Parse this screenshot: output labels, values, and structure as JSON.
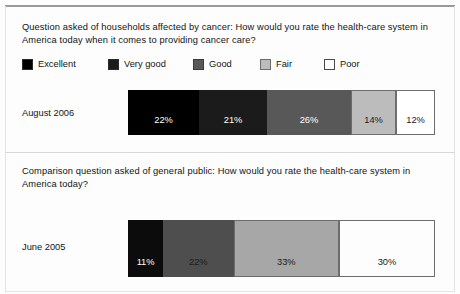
{
  "figure": {
    "top_rule_color": "#9a9a9a",
    "background": "#fdfdfd"
  },
  "sections": [
    {
      "question": "Question asked of households affected by cancer: How would you rate the health-care system in America today when it comes to providing cancer care?",
      "row_label": "August 2006"
    },
    {
      "question": "Comparison question asked of general public: How would you rate the health-care system in America today?",
      "row_label": "June 2005"
    }
  ],
  "legend": {
    "items": [
      {
        "label": "Excellent",
        "color": "#000000",
        "border": "#2b2b2b"
      },
      {
        "label": "Very good",
        "color": "#1b1b1b",
        "border": "#2b2b2b"
      },
      {
        "label": "Good",
        "color": "#585858",
        "border": "#3a3a3a"
      },
      {
        "label": "Fair",
        "color": "#bcbcbc",
        "border": "#6d6d6d"
      },
      {
        "label": "Poor",
        "color": "#ffffff",
        "border": "#4a4a4a"
      }
    ]
  },
  "chart_data": {
    "type": "bar",
    "orientation": "horizontal",
    "stacked": true,
    "percent_total": 100,
    "title": "",
    "xlabel": "",
    "ylabel": "",
    "grid": false,
    "legend_position": "top",
    "categories": [
      "Excellent",
      "Very good",
      "Good",
      "Fair",
      "Poor"
    ],
    "series": [
      {
        "name": "August 2006",
        "question": "Question asked of households affected by cancer: How would you rate the health-care system in America today when it comes to providing cancer care?",
        "segments": [
          {
            "category": "Excellent",
            "value": 22,
            "label": "22%",
            "color": "#000000",
            "text_color": "#ffffff"
          },
          {
            "category": "Very good",
            "value": 21,
            "label": "21%",
            "color": "#1b1b1b",
            "text_color": "#ffffff"
          },
          {
            "category": "Good",
            "value": 26,
            "label": "26%",
            "color": "#585858",
            "text_color": "#ffffff"
          },
          {
            "category": "Fair",
            "value": 14,
            "label": "14%",
            "color": "#bcbcbc",
            "text_color": "#1a1a1a"
          },
          {
            "category": "Poor",
            "value": 12,
            "label": "12%",
            "color": "#ffffff",
            "text_color": "#1a1a1a"
          }
        ]
      },
      {
        "name": "June 2005",
        "question": "Comparison question asked of general public: How would you rate the health-care system in America today?",
        "segments": [
          {
            "category": "Excellent",
            "value": 11,
            "label": "11%",
            "color": "#0c0c0c",
            "text_color": "#ffffff"
          },
          {
            "category": "Very good",
            "value": 22,
            "label": "22%",
            "color": "#4e4e4e",
            "text_color": "#1a1a1a"
          },
          {
            "category": "Good",
            "value": 33,
            "label": "33%",
            "color": "#a7a7a7",
            "text_color": "#1a1a1a"
          },
          {
            "category": "Poor",
            "value": 30,
            "label": "30%",
            "color": "#fdfdfd",
            "text_color": "#1a1a1a"
          }
        ]
      }
    ]
  }
}
